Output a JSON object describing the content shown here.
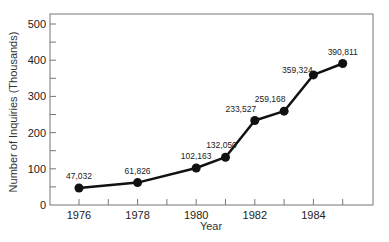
{
  "chart_data": {
    "type": "line",
    "title": "",
    "xlabel": "Year",
    "ylabel": "Number of Inquiries (Thousands)",
    "ylim": [
      0,
      530
    ],
    "xlim": [
      1975,
      1986
    ],
    "yticks": [
      0,
      100,
      200,
      300,
      400,
      500
    ],
    "xticks": [
      1976,
      1978,
      1980,
      1982,
      1984
    ],
    "grid": false,
    "legend": null,
    "series": [
      {
        "name": "Inquiries",
        "x": [
          1976,
          1978,
          1980,
          1981,
          1982,
          1983,
          1984,
          1985
        ],
        "values": [
          47.032,
          61.826,
          102.163,
          132.05,
          233.527,
          259.168,
          359.324,
          390.811
        ],
        "labels": [
          "47,032",
          "61,826",
          "102,163",
          "132,050",
          "233,527",
          "259,168",
          "359,324",
          "390,811"
        ]
      }
    ]
  }
}
